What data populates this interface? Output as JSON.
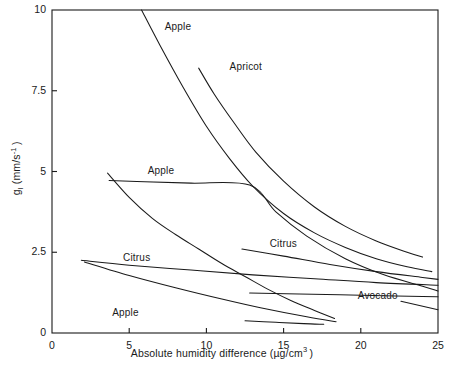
{
  "chart_data": {
    "type": "line",
    "title": "",
    "xlabel": "Absolute humidity difference (µg/cm³)",
    "ylabel": "gₗ (mm/s⁻¹)",
    "xlim": [
      0,
      25
    ],
    "ylim": [
      0,
      10
    ],
    "xticks": [
      "0",
      "5",
      "10",
      "15",
      "20",
      "25"
    ],
    "yticks": [
      "0",
      "2.5",
      "5",
      "7.5",
      "10"
    ],
    "grid": false,
    "legend_position": "inline-annotations",
    "axis_color": "#1a1a1a",
    "line_color": "#1a1a1a",
    "background": "#ffffff",
    "series": [
      {
        "name": "Apple",
        "label": "Apple",
        "label_x": 7.3,
        "label_y": 9.45,
        "points": [
          [
            5.8,
            10.0
          ],
          [
            7.0,
            8.9
          ],
          [
            8.5,
            7.6
          ],
          [
            10.0,
            6.4
          ],
          [
            11.5,
            5.4
          ],
          [
            13.0,
            4.55
          ],
          [
            15.0,
            3.7
          ],
          [
            17.0,
            3.1
          ],
          [
            19.0,
            2.65
          ],
          [
            21.0,
            2.3
          ],
          [
            23.0,
            2.05
          ],
          [
            24.6,
            1.9
          ]
        ]
      },
      {
        "name": "Apricot",
        "label": "Apricot",
        "label_x": 11.5,
        "label_y": 8.2,
        "points": [
          [
            9.5,
            8.2
          ],
          [
            10.5,
            7.4
          ],
          [
            11.8,
            6.5
          ],
          [
            13.2,
            5.6
          ],
          [
            15.0,
            4.7
          ],
          [
            17.0,
            3.9
          ],
          [
            19.0,
            3.3
          ],
          [
            21.0,
            2.85
          ],
          [
            23.0,
            2.5
          ],
          [
            24.0,
            2.35
          ]
        ]
      },
      {
        "name": "Apple",
        "label": "Apple",
        "label_x": 6.2,
        "label_y": 5.0,
        "points": [
          [
            3.7,
            4.72
          ],
          [
            6.0,
            4.68
          ],
          [
            9.0,
            4.64
          ],
          [
            12.8,
            4.58
          ],
          [
            14.5,
            3.75
          ],
          [
            16.5,
            3.0
          ],
          [
            19.0,
            2.3
          ],
          [
            21.5,
            1.8
          ],
          [
            24.0,
            1.45
          ],
          [
            25.0,
            1.3
          ]
        ]
      },
      {
        "name": "Apple",
        "label": "Apple",
        "label_x": 3.9,
        "label_y": 0.6,
        "descr": "steep descending apple curve from 4.9 to 0.3",
        "points": [
          [
            3.6,
            4.95
          ],
          [
            5.0,
            4.2
          ],
          [
            6.5,
            3.55
          ],
          [
            8.0,
            3.05
          ],
          [
            9.5,
            2.6
          ],
          [
            11.0,
            2.15
          ],
          [
            12.5,
            1.75
          ],
          [
            14.0,
            1.35
          ],
          [
            15.5,
            1.0
          ],
          [
            17.0,
            0.7
          ],
          [
            18.3,
            0.45
          ]
        ]
      },
      {
        "name": "Citrus",
        "label": "Citrus",
        "label_x": 14.1,
        "label_y": 2.72,
        "points": [
          [
            12.3,
            2.6
          ],
          [
            15.0,
            2.38
          ],
          [
            18.0,
            2.12
          ],
          [
            21.0,
            1.9
          ],
          [
            24.0,
            1.72
          ],
          [
            25.0,
            1.66
          ]
        ]
      },
      {
        "name": "Citrus",
        "label": "Citrus",
        "label_x": 4.6,
        "label_y": 2.3,
        "points": [
          [
            1.9,
            2.25
          ],
          [
            5.0,
            2.1
          ],
          [
            9.0,
            1.95
          ],
          [
            13.0,
            1.8
          ],
          [
            17.0,
            1.68
          ],
          [
            21.0,
            1.56
          ],
          [
            25.0,
            1.48
          ]
        ]
      },
      {
        "name": "Avocado",
        "label": "Avocado",
        "label_x": 19.8,
        "label_y": 1.12,
        "points": [
          [
            2.1,
            2.2
          ],
          [
            5.0,
            1.78
          ],
          [
            8.0,
            1.4
          ],
          [
            11.0,
            1.05
          ],
          [
            13.5,
            0.78
          ],
          [
            16.5,
            0.5
          ],
          [
            18.4,
            0.35
          ]
        ]
      },
      {
        "name": "Avocado-flat",
        "label": "",
        "points": [
          [
            12.8,
            1.24
          ],
          [
            16.0,
            1.21
          ],
          [
            20.0,
            1.17
          ],
          [
            24.0,
            1.13
          ],
          [
            25.0,
            1.12
          ]
        ]
      },
      {
        "name": "Apple-lower-short",
        "label": "",
        "points": [
          [
            12.5,
            0.38
          ],
          [
            14.5,
            0.33
          ],
          [
            16.3,
            0.29
          ],
          [
            17.6,
            0.27
          ]
        ]
      },
      {
        "name": "Avocado-leader",
        "label": "",
        "descr": "leader line from Avocado label to lower right curve",
        "points": [
          [
            22.6,
            0.98
          ],
          [
            25.0,
            0.72
          ]
        ]
      }
    ]
  }
}
